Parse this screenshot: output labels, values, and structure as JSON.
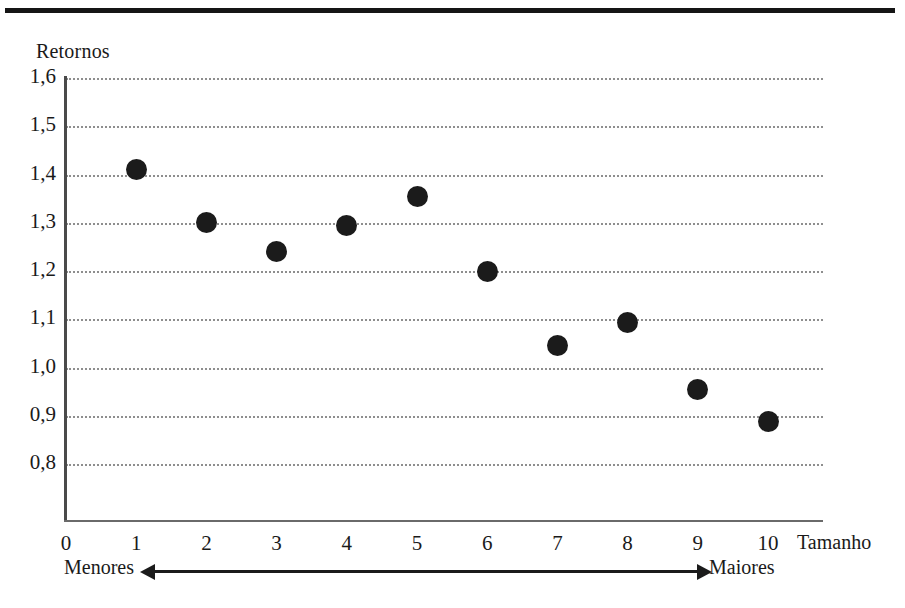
{
  "figure": {
    "top_rule": true,
    "point_color": "#1b1b1b",
    "gridline_color": "#8e8e8e",
    "axis_color": "#4a4a4a"
  },
  "annotations": {
    "left_label": "Menores",
    "right_label": "Maiores",
    "arrow": "double-headed-horizontal-arrow"
  },
  "chart_data": {
    "type": "scatter",
    "title": "",
    "xlabel": "Tamanho",
    "ylabel": "Retornos",
    "x": [
      1,
      2,
      3,
      4,
      5,
      6,
      7,
      8,
      9,
      10
    ],
    "values": [
      1.41,
      1.3,
      1.24,
      1.295,
      1.355,
      1.2,
      1.045,
      1.093,
      0.955,
      0.888
    ],
    "series": [
      {
        "name": "Retornos",
        "values": [
          1.41,
          1.3,
          1.24,
          1.295,
          1.355,
          1.2,
          1.045,
          1.093,
          0.955,
          0.888
        ]
      }
    ],
    "xlim": [
      0,
      10
    ],
    "ylim": [
      0.8,
      1.6
    ],
    "ytick_labels": [
      "1,6",
      "1,5",
      "1,4",
      "1,3",
      "1,2",
      "1,1",
      "1,0",
      "0,9",
      "0,8"
    ],
    "ytick_values": [
      1.6,
      1.5,
      1.4,
      1.3,
      1.2,
      1.1,
      1.0,
      0.9,
      0.8
    ],
    "xtick_labels": [
      "0",
      "1",
      "2",
      "3",
      "4",
      "5",
      "6",
      "7",
      "8",
      "9",
      "10"
    ],
    "xtick_values": [
      0,
      1,
      2,
      3,
      4,
      5,
      6,
      7,
      8,
      9,
      10
    ],
    "grid": "horizontal-dotted",
    "legend": "none",
    "decimal_separator": ","
  }
}
